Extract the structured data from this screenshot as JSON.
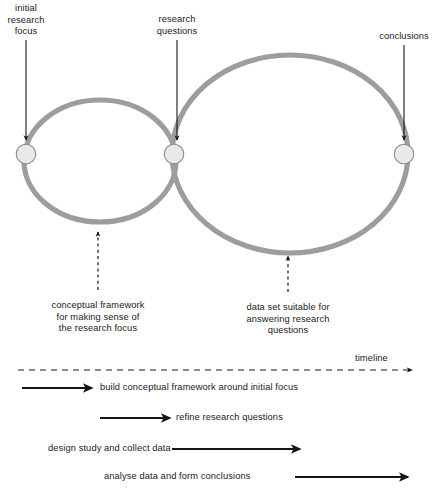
{
  "diagram": {
    "colors": {
      "loop_stroke": "#9d9d9d",
      "node_fill": "#e8e8e8",
      "node_stroke": "#8a8a8a",
      "arrow": "#151515",
      "text": "#1a1a1a"
    },
    "top_labels": [
      {
        "name": "initial-research-focus",
        "lines": [
          "initial",
          "research",
          "focus"
        ],
        "x": 26,
        "y": 3
      },
      {
        "name": "research-questions",
        "lines": [
          "research",
          "questions"
        ],
        "x": 177,
        "y": 14
      },
      {
        "name": "conclusions",
        "lines": [
          "conclusions"
        ],
        "x": 404,
        "y": 31
      }
    ],
    "nodes": [
      {
        "name": "node-initial-research-focus",
        "cx": 26,
        "cy": 154,
        "r": 10
      },
      {
        "name": "node-research-questions",
        "cx": 174,
        "cy": 154,
        "r": 10
      },
      {
        "name": "node-conclusions",
        "cx": 404,
        "cy": 154,
        "r": 10
      }
    ],
    "loops": [
      {
        "name": "left-loop",
        "cx": 100,
        "cy": 161,
        "rx": 76,
        "ry": 61
      },
      {
        "name": "right-loop",
        "cx": 290,
        "cy": 154,
        "rx": 118,
        "ry": 99
      }
    ],
    "bottom_captions": [
      {
        "name": "conceptual-framework-caption",
        "lines": [
          "conceptual framework",
          "for making sense of",
          "the research focus"
        ],
        "x": 98,
        "y": 300
      },
      {
        "name": "data-set-caption",
        "lines": [
          "data set suitable for",
          "answering research",
          "questions"
        ],
        "x": 288,
        "y": 302
      }
    ],
    "timeline": {
      "label": "timeline",
      "label_x": 375,
      "label_y": 353
    },
    "process_rows": [
      {
        "name": "build-conceptual-framework-row",
        "label": "build conceptual framework around initial focus",
        "label_x": 100,
        "label_y": 382,
        "arrow_x1": 22,
        "arrow_x2": 92,
        "arrow_y": 388,
        "label_align": "left"
      },
      {
        "name": "refine-research-questions-row",
        "label": "refine research questions",
        "label_x": 176,
        "label_y": 412,
        "arrow_x1": 100,
        "arrow_x2": 170,
        "arrow_y": 418,
        "label_align": "left"
      },
      {
        "name": "design-study-collect-data-row",
        "label": "design study and collect data",
        "label_x": 48,
        "label_y": 443,
        "arrow_x1": 172,
        "arrow_x2": 300,
        "arrow_y": 449,
        "label_align": "left"
      },
      {
        "name": "analyse-data-form-conclusions-row",
        "label": "analyse data and form conclusions",
        "label_x": 104,
        "label_y": 471,
        "arrow_x1": 295,
        "arrow_x2": 408,
        "arrow_y": 477,
        "label_align": "left"
      }
    ],
    "pointer_arrows": [
      {
        "name": "arrow-to-initial-research-focus",
        "x": 26,
        "y1": 40,
        "y2": 140,
        "style": "solid",
        "direction": "down"
      },
      {
        "name": "arrow-to-research-questions",
        "x": 177,
        "y1": 40,
        "y2": 140,
        "style": "solid",
        "direction": "down"
      },
      {
        "name": "arrow-to-conclusions",
        "x": 404,
        "y1": 45,
        "y2": 140,
        "style": "solid",
        "direction": "down"
      },
      {
        "name": "arrow-to-conceptual-framework",
        "x": 98,
        "y1": 290,
        "y2": 232,
        "style": "dashed",
        "direction": "up"
      },
      {
        "name": "arrow-to-data-set",
        "x": 288,
        "y1": 292,
        "y2": 256,
        "style": "dashed",
        "direction": "up"
      }
    ]
  }
}
